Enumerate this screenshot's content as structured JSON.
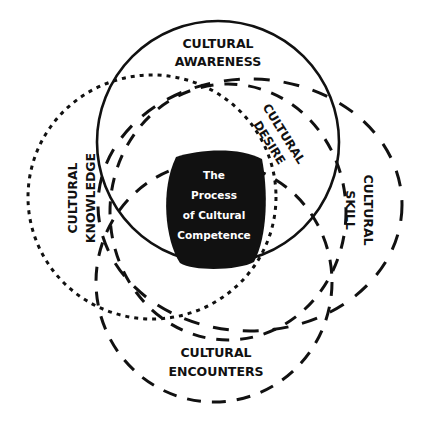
{
  "diagram": {
    "title": "The Process of Cultural Competence",
    "center": {
      "lines": [
        "The",
        "Process",
        "of Cultural",
        "Competence"
      ],
      "fill": "#111111",
      "text_color": "#ffffff"
    },
    "constructs": [
      {
        "id": "awareness",
        "lines": [
          "CULTURAL",
          "AWARENESS"
        ],
        "line_style": "solid"
      },
      {
        "id": "knowledge",
        "lines": [
          "CULTURAL",
          "KNOWLEDGE"
        ],
        "line_style": "dotted"
      },
      {
        "id": "desire",
        "lines": [
          "CULTURAL",
          "DESIRE"
        ],
        "line_style": "dashed"
      },
      {
        "id": "skill",
        "lines": [
          "CULTURAL",
          "SKILL"
        ],
        "line_style": "long-dashed"
      },
      {
        "id": "encounters",
        "lines": [
          "CULTURAL",
          "ENCOUNTERS"
        ],
        "line_style": "dashed"
      }
    ],
    "colors": {
      "stroke": "#111111",
      "background": "#ffffff"
    }
  }
}
